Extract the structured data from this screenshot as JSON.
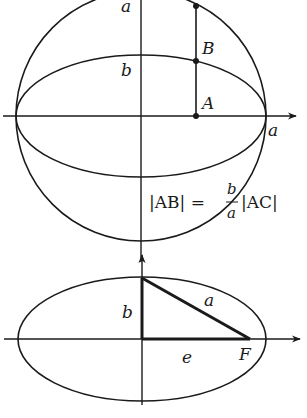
{
  "diagram": {
    "top_figure": {
      "labels": {
        "a_top": "a",
        "b_mid": "b",
        "point_B": "B",
        "point_A": "A",
        "a_right": "a"
      },
      "formula": {
        "left": "|AB| = ",
        "numerator": "b",
        "denominator": "a",
        "right": "|AC|"
      }
    },
    "bottom_figure": {
      "labels": {
        "b": "b",
        "a": "a",
        "e": "e",
        "F": "F"
      }
    },
    "colors": {
      "stroke": "#1a1a1a",
      "background": "#ffffff"
    }
  }
}
